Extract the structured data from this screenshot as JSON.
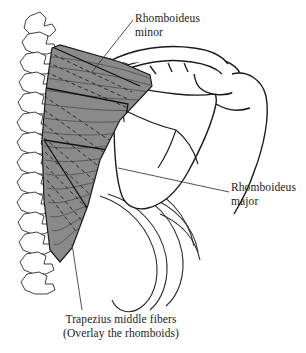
{
  "figure": {
    "background_color": "#ffffff",
    "width": 306,
    "height": 353
  },
  "labels": {
    "rhomboideus_minor": {
      "line1": "Rhomboideus",
      "line2": "minor"
    },
    "rhomboideus_major": {
      "line1": "Rhomboideus",
      "line2": "major"
    },
    "caption": {
      "line1": "Trapezius middle fibers",
      "line2": "(Overlay the rhomboids)"
    }
  },
  "anatomy": {
    "vertebral_column": "vertebrae-column",
    "scapula": "scapula-bone",
    "clavicle": "clavicle-bone",
    "acromion": "acromion-process",
    "humerus": "humeral-head",
    "ribs": "rib-cage",
    "trapezius_overlay": "trapezius-middle-fibers",
    "rhomboid_minor_fibers": "rhomboideus-minor-fibers",
    "rhomboid_major_fibers": "rhomboideus-major-fibers"
  },
  "colors": {
    "outline": "#1a1a1a",
    "muscle_fill": "#8a8a8a",
    "muscle_fiber_dark": "#4a4a4a",
    "hidden_fiber": "#2b2b2b",
    "leader_line": "#333333",
    "bone_fill": "#ffffff",
    "text": "#1a1a1a"
  },
  "leader_lines": {
    "minor": "leader-line-rhomboideus-minor",
    "major": "leader-line-rhomboideus-major",
    "caption": "leader-line-trapezius-caption"
  }
}
